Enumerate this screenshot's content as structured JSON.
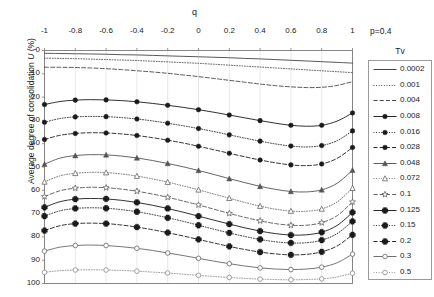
{
  "figure": {
    "annotation_p": "p=0.4",
    "legend_title": "Tv",
    "x_axis_title": "q",
    "y_axis_title": "Average degree of consolidation U (%)",
    "y_axis_title_plain": "Average degree of consolidation ",
    "y_axis_title_italic": "U",
    "y_axis_title_unit": " (%)"
  },
  "chart_data": {
    "type": "line",
    "title": "",
    "subtitle": "",
    "annotation": "p=0.4",
    "xlabel": "q",
    "ylabel": "Average degree of consolidation U (%)",
    "xlim": [
      -1,
      1
    ],
    "ylim": [
      0,
      100
    ],
    "y_inverted": true,
    "x_axis_position": "top",
    "grid": true,
    "grid_axis": "x",
    "legend_position": "right",
    "legend_title": "Tv",
    "xticks": [
      -1,
      -0.8,
      -0.6,
      -0.4,
      -0.2,
      0,
      0.2,
      0.4,
      0.6,
      0.8,
      1
    ],
    "xticklabels": [
      "-1",
      "-0.8",
      "-0.6",
      "-0.4",
      "-0.2",
      "0",
      "0.2",
      "0.4",
      "0.6",
      "0.8",
      "1"
    ],
    "yticks": [
      0,
      10,
      20,
      30,
      40,
      50,
      60,
      70,
      80,
      90,
      100
    ],
    "yticklabels": [
      "0",
      "10",
      "20",
      "30",
      "40",
      "50",
      "60",
      "70",
      "80",
      "90",
      "100"
    ],
    "x": [
      -1,
      -0.9,
      -0.8,
      -0.7,
      -0.6,
      -0.5,
      -0.4,
      -0.3,
      -0.2,
      -0.1,
      0,
      0.1,
      0.2,
      0.3,
      0.4,
      0.5,
      0.6,
      0.7,
      0.8,
      0.9,
      1
    ],
    "series": [
      {
        "name": "0.0002",
        "label": "0.0002",
        "style": "solid",
        "marker": "none",
        "color": "#3a3a3a",
        "values": [
          1.2,
          1.3,
          1.4,
          1.5,
          1.6,
          1.8,
          1.9,
          2.1,
          2.3,
          2.5,
          2.7,
          2.9,
          3.1,
          3.4,
          3.6,
          3.9,
          4.2,
          4.5,
          4.8,
          5.1,
          5.4
        ]
      },
      {
        "name": "0.001",
        "label": "0.001",
        "style": "dotted",
        "marker": "none",
        "color": "#3a3a3a",
        "values": [
          3.3,
          3.4,
          3.5,
          3.7,
          3.9,
          4.1,
          4.3,
          4.6,
          4.9,
          5.2,
          5.5,
          5.9,
          6.3,
          6.7,
          7.1,
          7.5,
          7.9,
          8.3,
          8.7,
          9.1,
          9.5
        ]
      },
      {
        "name": "0.004",
        "label": "0.004",
        "style": "dashed",
        "marker": "none",
        "color": "#3a3a3a",
        "values": [
          7.2,
          7.2,
          7.3,
          7.5,
          7.8,
          8.2,
          8.7,
          9.2,
          9.8,
          10.5,
          11.2,
          12.0,
          12.8,
          13.6,
          14.4,
          15.1,
          15.6,
          15.9,
          15.8,
          15.0,
          13.4
        ]
      },
      {
        "name": "0.008",
        "label": "0.008",
        "style": "solid",
        "marker": "circle-filled",
        "color": "#1a1a1a",
        "values": [
          23.2,
          21.9,
          21.3,
          21.1,
          21.2,
          21.5,
          22.0,
          22.7,
          23.5,
          24.4,
          25.4,
          26.5,
          27.7,
          28.9,
          30.1,
          31.2,
          32.1,
          32.5,
          32.1,
          30.3,
          26.8
        ]
      },
      {
        "name": "0.016",
        "label": "0.016",
        "style": "dotted",
        "marker": "circle-filled",
        "color": "#1a1a1a",
        "values": [
          30.8,
          29.2,
          28.5,
          28.3,
          28.4,
          28.8,
          29.4,
          30.2,
          31.2,
          32.3,
          33.5,
          34.8,
          36.2,
          37.6,
          38.9,
          40.1,
          41.0,
          41.4,
          40.8,
          38.7,
          34.5
        ]
      },
      {
        "name": "0.028",
        "label": "0.028",
        "style": "dashed",
        "marker": "circle-filled",
        "color": "#1a1a1a",
        "values": [
          38.2,
          36.4,
          35.6,
          35.3,
          35.4,
          35.8,
          36.5,
          37.4,
          38.5,
          39.7,
          41.1,
          42.6,
          44.1,
          45.6,
          47.0,
          48.2,
          49.1,
          49.4,
          48.7,
          46.3,
          41.6
        ]
      },
      {
        "name": "0.048",
        "label": "0.048",
        "style": "solid",
        "marker": "triangle-filled",
        "color": "#555555",
        "values": [
          48.8,
          46.2,
          45.1,
          44.7,
          44.8,
          45.3,
          46.1,
          47.2,
          48.5,
          49.9,
          51.5,
          53.2,
          55.0,
          56.7,
          58.3,
          59.6,
          60.5,
          60.7,
          59.8,
          57.0,
          51.4
        ]
      },
      {
        "name": "0.072",
        "label": "0.072",
        "style": "dotted",
        "marker": "triangle-open",
        "color": "#666666",
        "values": [
          56.4,
          53.8,
          52.7,
          52.3,
          52.4,
          53.0,
          53.9,
          55.1,
          56.5,
          58.1,
          59.8,
          61.6,
          63.4,
          65.2,
          66.8,
          68.1,
          68.9,
          69.0,
          68.0,
          65.0,
          59.1
        ]
      },
      {
        "name": "0.1",
        "label": "0.1",
        "style": "dashed",
        "marker": "star-open",
        "color": "#555555",
        "values": [
          62.7,
          60.2,
          59.1,
          58.7,
          58.9,
          59.5,
          60.4,
          61.6,
          63.0,
          64.6,
          66.3,
          68.1,
          69.9,
          71.6,
          73.1,
          74.3,
          75.0,
          75.0,
          73.9,
          70.9,
          65.0
        ]
      },
      {
        "name": "0.125",
        "label": "0.125",
        "style": "solid",
        "marker": "plus-filled",
        "color": "#1a1a1a",
        "values": [
          67.3,
          64.9,
          63.8,
          63.5,
          63.7,
          64.3,
          65.2,
          66.4,
          67.8,
          69.4,
          71.1,
          72.8,
          74.5,
          76.1,
          77.5,
          78.6,
          79.2,
          79.1,
          78.0,
          75.1,
          69.5
        ]
      },
      {
        "name": "0.15",
        "label": "0.15",
        "style": "dotted",
        "marker": "plus-filled",
        "color": "#1a1a1a",
        "values": [
          71.1,
          68.8,
          67.8,
          67.5,
          67.7,
          68.3,
          69.2,
          70.4,
          71.8,
          73.3,
          75.0,
          76.7,
          78.3,
          79.8,
          81.1,
          82.1,
          82.6,
          82.5,
          81.4,
          78.6,
          73.3
        ]
      },
      {
        "name": "0.2",
        "label": "0.2",
        "style": "dashed",
        "marker": "plus-filled",
        "color": "#1a1a1a",
        "values": [
          77.3,
          75.2,
          74.3,
          74.1,
          74.3,
          74.9,
          75.8,
          76.9,
          78.2,
          79.6,
          81.1,
          82.6,
          84.1,
          85.4,
          86.5,
          87.3,
          87.7,
          87.5,
          86.4,
          83.9,
          79.1
        ]
      },
      {
        "name": "0.3",
        "label": "0.3",
        "style": "solid",
        "marker": "circle-open",
        "color": "#666666",
        "values": [
          86.1,
          84.4,
          83.7,
          83.5,
          83.7,
          84.2,
          84.9,
          85.8,
          86.9,
          88.0,
          89.2,
          90.4,
          91.5,
          92.5,
          93.3,
          93.8,
          94.0,
          93.8,
          93.0,
          91.1,
          87.4
        ]
      },
      {
        "name": "0.5",
        "label": "0.5",
        "style": "dotted",
        "marker": "circle-open",
        "color": "#8a8a8a",
        "values": [
          95.2,
          94.5,
          94.2,
          94.1,
          94.2,
          94.4,
          94.7,
          95.1,
          95.5,
          96.0,
          96.5,
          97.0,
          97.4,
          97.8,
          98.1,
          98.3,
          98.4,
          98.3,
          98.0,
          97.2,
          95.6
        ]
      }
    ]
  }
}
